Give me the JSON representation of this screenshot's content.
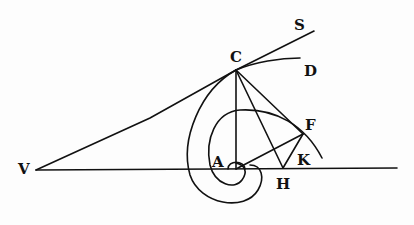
{
  "diagram": {
    "title": "",
    "labels": {
      "S": "S",
      "C": "C",
      "D": "D",
      "F": "F",
      "A": "A",
      "K": "K",
      "V": "V",
      "H": "H"
    },
    "points": {
      "V": [
        36,
        170
      ],
      "A": [
        236,
        169
      ],
      "C": [
        236,
        70
      ],
      "S": [
        314,
        32
      ],
      "D": [
        300,
        58
      ],
      "F": [
        303,
        134
      ],
      "H": [
        283,
        169
      ],
      "K": [
        296,
        160
      ]
    },
    "colors": {
      "ink": "#111111",
      "paper": "#fdfdfd"
    }
  }
}
